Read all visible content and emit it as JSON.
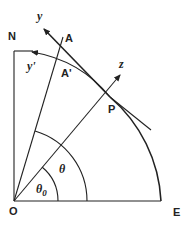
{
  "diagram": {
    "labels": {
      "origin": "O",
      "east": "E",
      "north": "N",
      "point_a": "A",
      "point_a_prime": "A'",
      "point_p": "P",
      "axis_y": "y",
      "axis_y_prime": "y'",
      "axis_z": "z",
      "angle_theta": "θ",
      "angle_theta0_base": "θ",
      "angle_theta0_sub": "0"
    }
  }
}
